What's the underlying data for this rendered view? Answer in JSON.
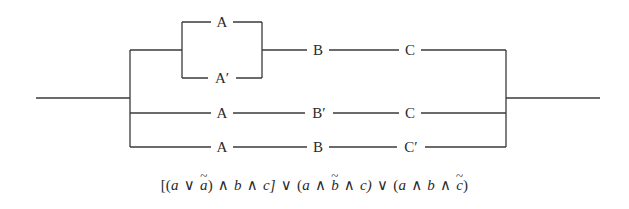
{
  "diagram": {
    "type": "switching-circuit",
    "branches": [
      {
        "name": "branch-1",
        "parallel_block": {
          "top": "A",
          "bottom": "A′"
        },
        "series": [
          "B",
          "C"
        ]
      },
      {
        "name": "branch-2",
        "series": [
          "A",
          "B′",
          "C"
        ]
      },
      {
        "name": "branch-3",
        "series": [
          "A",
          "B",
          "C′"
        ]
      }
    ],
    "labels": {
      "a_top": "A",
      "a_prime_bottom": "A′",
      "row1_b": "B",
      "row1_c": "C",
      "row2_a": "A",
      "row2_b_prime": "B′",
      "row2_c": "C",
      "row3_a": "A",
      "row3_b": "B",
      "row3_c_prime": "C′"
    }
  },
  "formula": {
    "text": "[(a ∨ ã) ∧ b ∧ c] ∨ (a ∧ b̃ ∧ c) ∨ (a ∧ b ∧ c̃)",
    "parts": {
      "open1": "[(",
      "a1": "a",
      "or1": "∨",
      "a_tilde": "a",
      "close_a": ")",
      "and1": "∧",
      "b1": "b",
      "and2": "∧",
      "c1": "c]",
      "or2": "∨",
      "open2": "(",
      "a2": "a",
      "and3": "∧",
      "b_tilde": "b",
      "and4": "∧",
      "c2": "c)",
      "or3": "∨",
      "open3": "(",
      "a3": "a",
      "and5": "∧",
      "b3": "b",
      "and6": "∧",
      "c_tilde": "c",
      "close3": ")"
    }
  },
  "colors": {
    "ink": "#2a2a2a",
    "background": "#ffffff"
  }
}
